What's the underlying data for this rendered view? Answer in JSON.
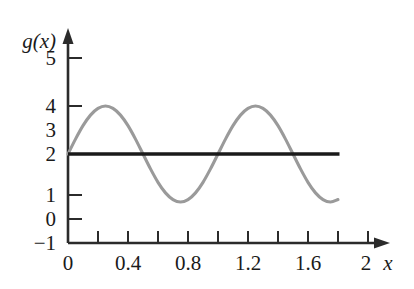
{
  "chart_data": {
    "type": "line",
    "title": "",
    "xlabel": "x",
    "ylabel": "g(x)",
    "xlim": [
      0,
      2.0
    ],
    "ylim": [
      -1,
      5.6
    ],
    "grid": false,
    "legend": "none",
    "x_ticks": [
      0,
      0.2,
      0.4,
      0.6,
      0.8,
      1.0,
      1.2,
      1.4,
      1.6,
      1.8,
      2.0
    ],
    "x_tick_labels": [
      "0",
      "",
      "0.4",
      "",
      "0.8",
      "",
      "1.2",
      "",
      "1.6",
      "",
      "2"
    ],
    "y_ticks": [
      -1,
      0,
      1,
      2,
      3,
      4,
      5
    ],
    "y_tick_labels": [
      "−1",
      "0",
      "1",
      "2",
      "3",
      "4",
      "5"
    ],
    "series": [
      {
        "name": "g(x)",
        "type": "curve",
        "color": "#9a9a9a",
        "x_start": 0.0,
        "x_end": 1.8,
        "description": "sinusoid, midline 2, amplitude 2, period 1",
        "points": [
          {
            "x": 0.0,
            "y": 2.0
          },
          {
            "x": 0.05,
            "y": 2.62
          },
          {
            "x": 0.1,
            "y": 3.18
          },
          {
            "x": 0.15,
            "y": 3.62
          },
          {
            "x": 0.2,
            "y": 3.9
          },
          {
            "x": 0.25,
            "y": 4.0
          },
          {
            "x": 0.3,
            "y": 3.9
          },
          {
            "x": 0.35,
            "y": 3.62
          },
          {
            "x": 0.4,
            "y": 3.18
          },
          {
            "x": 0.45,
            "y": 2.62
          },
          {
            "x": 0.5,
            "y": 2.0
          },
          {
            "x": 0.55,
            "y": 1.38
          },
          {
            "x": 0.6,
            "y": 0.82
          },
          {
            "x": 0.65,
            "y": 0.38
          },
          {
            "x": 0.7,
            "y": 0.1
          },
          {
            "x": 0.75,
            "y": 0.0
          },
          {
            "x": 0.8,
            "y": 0.1
          },
          {
            "x": 0.85,
            "y": 0.38
          },
          {
            "x": 0.9,
            "y": 0.82
          },
          {
            "x": 0.95,
            "y": 1.38
          },
          {
            "x": 1.0,
            "y": 2.0
          },
          {
            "x": 1.05,
            "y": 2.62
          },
          {
            "x": 1.1,
            "y": 3.18
          },
          {
            "x": 1.15,
            "y": 3.62
          },
          {
            "x": 1.2,
            "y": 3.9
          },
          {
            "x": 1.25,
            "y": 4.0
          },
          {
            "x": 1.3,
            "y": 3.9
          },
          {
            "x": 1.35,
            "y": 3.62
          },
          {
            "x": 1.4,
            "y": 3.18
          },
          {
            "x": 1.45,
            "y": 2.62
          },
          {
            "x": 1.5,
            "y": 2.0
          },
          {
            "x": 1.55,
            "y": 1.38
          },
          {
            "x": 1.6,
            "y": 0.82
          },
          {
            "x": 1.65,
            "y": 0.38
          },
          {
            "x": 1.7,
            "y": 0.1
          },
          {
            "x": 1.75,
            "y": 0.0
          },
          {
            "x": 1.8,
            "y": 0.1
          }
        ]
      },
      {
        "name": "y = 2",
        "type": "horizontal_line",
        "color": "#1a1a1a",
        "y": 2.0,
        "x_start": 0.0,
        "x_end": 1.81
      }
    ],
    "annotations": []
  }
}
